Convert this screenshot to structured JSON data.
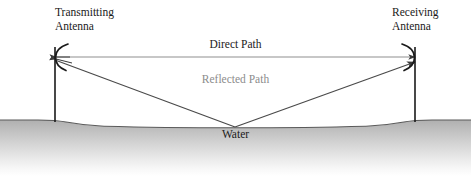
{
  "figure": {
    "type": "propagation-path-diagram",
    "width": 471,
    "height": 176,
    "background": "#ffffff"
  },
  "labels": {
    "transmitting_antenna_line1": "Transmitting",
    "transmitting_antenna_line2": "Antenna",
    "receiving_antenna_line1": "Receiving",
    "receiving_antenna_line2": "Antenna",
    "direct_path": "Direct Path",
    "reflected_path": "Reflected Path",
    "water": "Water"
  },
  "colors": {
    "text_dark": "#1a1a1a",
    "text_gray": "#8c8c8c",
    "direct_path_line": "#8a8a8a",
    "reflected_path_line": "#4a4a4a",
    "mast": "#1a1a1a",
    "ground_outline": "#4a4a4a",
    "ground_fill_top": "#b4b4b4",
    "ground_fill_bottom": "#ffffff"
  },
  "geometry": {
    "transmit_mast_x": 55,
    "receive_mast_x": 415,
    "mast_top_y": 47,
    "mast_base_y": 122,
    "direct_path_y": 57,
    "reflection_point_x": 235,
    "reflection_point_y": 126,
    "bank_top_y": 120,
    "water_surface_y": 126
  }
}
